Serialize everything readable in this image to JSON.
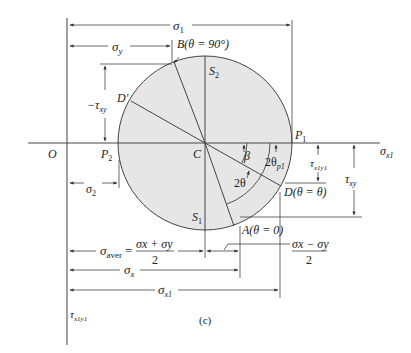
{
  "figure": {
    "caption": "(c)"
  },
  "colors": {
    "line": "#333333",
    "circle_fill": "#e6e6e6",
    "text": "#222222"
  },
  "axes": {
    "origin_label": "O",
    "sigma_axis_label": "σ",
    "sigma_axis_sub": "x1",
    "tau_axis_label": "τ",
    "tau_axis_sub": "x1y1"
  },
  "points": {
    "center": "C",
    "p1": "P",
    "p1_sub": "1",
    "p2": "P",
    "p2_sub": "2",
    "s1": "S",
    "s1_sub": "1",
    "s2": "S",
    "s2_sub": "2",
    "a": "A(θ = 0)",
    "b": "B(θ = 90°)",
    "d": "D(θ = θ)",
    "d_prime": "D′"
  },
  "angles": {
    "beta": "β",
    "two_theta": "2θ",
    "two_theta_p": "2θ",
    "two_theta_p_sub": "p1"
  },
  "dimensions": {
    "sigma1": {
      "sym": "σ",
      "sub": "1"
    },
    "sigma_y": {
      "sym": "σ",
      "sub": "y"
    },
    "neg_tau_xy": {
      "sym": "−τ",
      "sub": "xy"
    },
    "sigma2": {
      "sym": "σ",
      "sub": "2"
    },
    "sigma_aver": {
      "sym": "σ",
      "sub": "aver",
      "eq": "=",
      "num": "σx + σy",
      "den": "2"
    },
    "half_diff": {
      "num": "σx − σy",
      "den": "2"
    },
    "sigma_x": {
      "sym": "σ",
      "sub": "x"
    },
    "sigma_x1": {
      "sym": "σ",
      "sub": "x1"
    },
    "tau_x1y1": {
      "sym": "τ",
      "sub": "x1y1"
    },
    "tau_xy": {
      "sym": "τ",
      "sub": "xy"
    }
  }
}
